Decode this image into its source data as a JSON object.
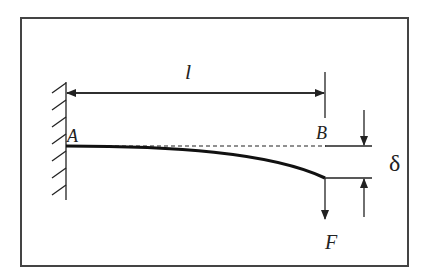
{
  "figure": {
    "labels": {
      "length": "l",
      "fixed_end": "A",
      "free_end": "B",
      "deflection": "δ",
      "force": "F"
    },
    "colors": {
      "line": "#222222",
      "frame": "#444444",
      "background": "#ffffff"
    }
  }
}
